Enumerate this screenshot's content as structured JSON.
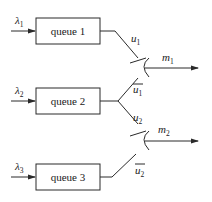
{
  "diagram": {
    "type": "queue-merge-routing",
    "queues": [
      {
        "label": "queue 1",
        "arrival": {
          "symbol": "λ",
          "sub": "1"
        }
      },
      {
        "label": "queue 2",
        "arrival": {
          "symbol": "λ",
          "sub": "2"
        }
      },
      {
        "label": "queue 3",
        "arrival": {
          "symbol": "λ",
          "sub": "3"
        }
      }
    ],
    "routes": [
      {
        "symbol": "u",
        "sub": "1",
        "overline": false
      },
      {
        "symbol": "u",
        "sub": "1",
        "overline": true
      },
      {
        "symbol": "u",
        "sub": "2",
        "overline": false
      },
      {
        "symbol": "u",
        "sub": "2",
        "overline": true
      }
    ],
    "merges": [
      {
        "symbol": "m",
        "sub": "1"
      },
      {
        "symbol": "m",
        "sub": "2"
      }
    ]
  }
}
